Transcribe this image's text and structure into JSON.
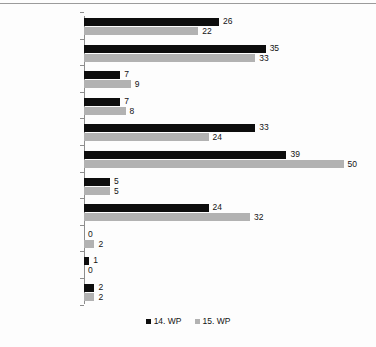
{
  "chart_data": {
    "type": "bar",
    "orientation": "horizontal",
    "title": "",
    "xlabel": "",
    "ylabel": "",
    "grid": false,
    "legend_position": "bottom-center",
    "xlim": [
      0,
      50
    ],
    "categories": [
      "Politik",
      "Wirtschaft",
      "Infrastruktur",
      "Umwelt",
      "Bildung",
      "Inneres",
      "Landwirtschaft",
      "Sozial",
      "Integration",
      "Europa",
      "Kirche"
    ],
    "series": [
      {
        "name": "14. WP",
        "color": "#0d0d0d",
        "values": [
          26,
          35,
          7,
          7,
          33,
          39,
          5,
          24,
          0,
          1,
          2
        ]
      },
      {
        "name": "15. WP",
        "color": "#b2b2b2",
        "values": [
          22,
          33,
          9,
          8,
          24,
          50,
          5,
          32,
          2,
          0,
          2
        ]
      }
    ]
  },
  "legend": {
    "items": [
      {
        "label": "14. WP",
        "color": "#0d0d0d"
      },
      {
        "label": "15. WP",
        "color": "#b2b2b2"
      }
    ]
  }
}
